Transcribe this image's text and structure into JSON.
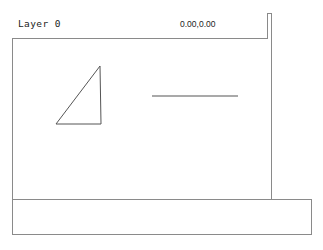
{
  "window": {
    "title": "Drawing Editor"
  },
  "header": {
    "layer_label": "Layer 0",
    "coordinate_readout": "0.00,0.00"
  },
  "canvas": {
    "background_color": "#ffffff",
    "stroke_color": "#555555",
    "shapes": [
      {
        "name": "right-triangle",
        "type": "polygon",
        "points": "43,85 87,27 88,85"
      },
      {
        "name": "horizontal-line",
        "type": "line",
        "x1": 139,
        "y1": 57,
        "x2": 225,
        "y2": 57
      }
    ]
  },
  "side_panel": {
    "content": ""
  },
  "bottom_bar": {
    "command_text": ""
  },
  "colors": {
    "frame_border": "#8a8a8a",
    "geometry_stroke": "#555555",
    "text": "#1c1c1c",
    "background": "#ffffff"
  }
}
